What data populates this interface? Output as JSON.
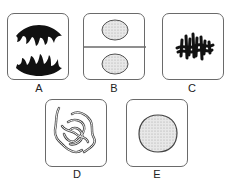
{
  "figure": {
    "type": "cell division stages diagram",
    "panels": [
      {
        "id": "A",
        "label": "A",
        "depicts": "two separated chromosome groups (anaphase)"
      },
      {
        "id": "B",
        "label": "B",
        "depicts": "two daughter cells with nuclei (telophase/cytokinesis)"
      },
      {
        "id": "C",
        "label": "C",
        "depicts": "chromosomes aligned at center (metaphase)"
      },
      {
        "id": "D",
        "label": "D",
        "depicts": "condensing thread-like chromosomes (prophase)"
      },
      {
        "id": "E",
        "label": "E",
        "depicts": "single stippled nucleus (interphase)"
      }
    ]
  },
  "colors": {
    "outline": "#6a6a6a",
    "chromosome": "#111111",
    "nucleus_fill": "#e4e4e4",
    "text": "#222222"
  }
}
